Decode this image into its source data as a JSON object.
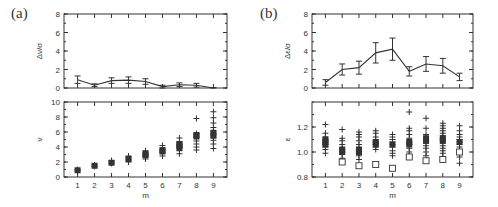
{
  "figure": {
    "panel_a_label": "(a)",
    "panel_b_label": "(b)"
  },
  "chart_data": [
    {
      "id": "a-top",
      "type": "line",
      "panel": "(a)",
      "title": "",
      "xlabel": "",
      "ylabel": "Δν/σ",
      "x": [
        1,
        2,
        3,
        4,
        5,
        6,
        7,
        8,
        9
      ],
      "values": [
        0.9,
        0.3,
        0.8,
        0.85,
        0.7,
        0.15,
        0.35,
        0.3,
        0.0
      ],
      "errors": [
        0.4,
        0.15,
        0.3,
        0.35,
        0.3,
        0.15,
        0.2,
        0.2,
        0.05
      ],
      "ylim": [
        0,
        8
      ],
      "yticks": [
        0,
        2,
        4,
        6,
        8
      ],
      "grid": false
    },
    {
      "id": "a-bottom",
      "type": "scatter",
      "panel": "(a)",
      "title": "",
      "xlabel": "m",
      "ylabel": "ν",
      "x": [
        1,
        2,
        3,
        4,
        5,
        6,
        7,
        8,
        9
      ],
      "series": [
        {
          "name": "crosses",
          "marker": "+",
          "points": [
            [
              1,
              0.8
            ],
            [
              1,
              1.0
            ],
            [
              2,
              1.4
            ],
            [
              2,
              1.6
            ],
            [
              3,
              1.8
            ],
            [
              3,
              2.0
            ],
            [
              3,
              2.2
            ],
            [
              4,
              2.0
            ],
            [
              4,
              2.3
            ],
            [
              4,
              2.6
            ],
            [
              4,
              2.8
            ],
            [
              5,
              2.4
            ],
            [
              5,
              2.8
            ],
            [
              5,
              3.1
            ],
            [
              5,
              3.5
            ],
            [
              6,
              2.8
            ],
            [
              6,
              3.2
            ],
            [
              6,
              3.6
            ],
            [
              6,
              4.2
            ],
            [
              7,
              3.1
            ],
            [
              7,
              3.5
            ],
            [
              7,
              3.9
            ],
            [
              7,
              4.3
            ],
            [
              7,
              4.7
            ],
            [
              7,
              5.2
            ],
            [
              8,
              3.6
            ],
            [
              8,
              4.0
            ],
            [
              8,
              4.4
            ],
            [
              8,
              4.8
            ],
            [
              8,
              5.3
            ],
            [
              8,
              5.8
            ],
            [
              8,
              7.8
            ],
            [
              9,
              3.8
            ],
            [
              9,
              4.4
            ],
            [
              9,
              4.9
            ],
            [
              9,
              5.3
            ],
            [
              9,
              5.7
            ],
            [
              9,
              6.1
            ],
            [
              9,
              6.6
            ],
            [
              9,
              7.2
            ],
            [
              9,
              7.9
            ],
            [
              9,
              8.7
            ]
          ]
        },
        {
          "name": "squares",
          "marker": "■",
          "points": [
            [
              1,
              0.9
            ],
            [
              2,
              1.5
            ],
            [
              3,
              1.9
            ],
            [
              4,
              2.4
            ],
            [
              5,
              2.9
            ],
            [
              5,
              3.1
            ],
            [
              6,
              3.4
            ],
            [
              6,
              3.6
            ],
            [
              7,
              3.9
            ],
            [
              7,
              4.2
            ],
            [
              7,
              4.4
            ],
            [
              8,
              5.4
            ],
            [
              8,
              5.6
            ],
            [
              9,
              5.5
            ],
            [
              9,
              5.9
            ]
          ]
        }
      ],
      "ylim": [
        0,
        10
      ],
      "yticks": [
        0,
        2,
        4,
        6,
        8,
        10
      ],
      "xticks": [
        1,
        2,
        3,
        4,
        5,
        6,
        7,
        8,
        9
      ],
      "grid": false
    },
    {
      "id": "b-top",
      "type": "line",
      "panel": "(b)",
      "title": "",
      "xlabel": "",
      "ylabel": "Δε/σ",
      "x": [
        1,
        2,
        3,
        4,
        5,
        6,
        7,
        8,
        9
      ],
      "values": [
        0.6,
        2.0,
        2.2,
        3.8,
        4.2,
        1.8,
        2.6,
        2.4,
        1.2
      ],
      "errors": [
        0.3,
        0.6,
        0.7,
        1.1,
        1.2,
        0.5,
        0.8,
        0.8,
        0.4
      ],
      "ylim": [
        0,
        8
      ],
      "yticks": [
        0,
        2,
        4,
        6,
        8
      ],
      "grid": false
    },
    {
      "id": "b-bottom",
      "type": "scatter",
      "panel": "(b)",
      "title": "",
      "xlabel": "m",
      "ylabel": "ε",
      "x": [
        1,
        2,
        3,
        4,
        5,
        6,
        7,
        8,
        9
      ],
      "series": [
        {
          "name": "crosses",
          "marker": "+",
          "points": [
            [
              1,
              0.99
            ],
            [
              1,
              1.02
            ],
            [
              1,
              1.04
            ],
            [
              1,
              1.06
            ],
            [
              1,
              1.08
            ],
            [
              1,
              1.1
            ],
            [
              1,
              1.12
            ],
            [
              1,
              1.15
            ],
            [
              1,
              1.22
            ],
            [
              2,
              0.92
            ],
            [
              2,
              0.95
            ],
            [
              2,
              0.98
            ],
            [
              2,
              1.0
            ],
            [
              2,
              1.03
            ],
            [
              2,
              1.06
            ],
            [
              2,
              1.09
            ],
            [
              2,
              1.11
            ],
            [
              2,
              1.18
            ],
            [
              3,
              0.94
            ],
            [
              3,
              0.97
            ],
            [
              3,
              0.99
            ],
            [
              3,
              1.01
            ],
            [
              3,
              1.03
            ],
            [
              3,
              1.06
            ],
            [
              3,
              1.09
            ],
            [
              3,
              1.12
            ],
            [
              3,
              1.14
            ],
            [
              3,
              1.16
            ],
            [
              4,
              1.02
            ],
            [
              4,
              1.04
            ],
            [
              4,
              1.06
            ],
            [
              4,
              1.08
            ],
            [
              4,
              1.1
            ],
            [
              4,
              1.12
            ],
            [
              4,
              1.15
            ],
            [
              4,
              1.17
            ],
            [
              5,
              0.97
            ],
            [
              5,
              0.99
            ],
            [
              5,
              1.01
            ],
            [
              5,
              1.04
            ],
            [
              5,
              1.06
            ],
            [
              5,
              1.08
            ],
            [
              5,
              1.1
            ],
            [
              5,
              1.12
            ],
            [
              5,
              1.14
            ],
            [
              6,
              0.97
            ],
            [
              6,
              1.0
            ],
            [
              6,
              1.03
            ],
            [
              6,
              1.06
            ],
            [
              6,
              1.08
            ],
            [
              6,
              1.11
            ],
            [
              6,
              1.14
            ],
            [
              6,
              1.17
            ],
            [
              6,
              1.19
            ],
            [
              6,
              1.32
            ],
            [
              7,
              0.97
            ],
            [
              7,
              1.0
            ],
            [
              7,
              1.03
            ],
            [
              7,
              1.05
            ],
            [
              7,
              1.07
            ],
            [
              7,
              1.09
            ],
            [
              7,
              1.11
            ],
            [
              7,
              1.14
            ],
            [
              7,
              1.19
            ],
            [
              7,
              1.27
            ],
            [
              8,
              0.96
            ],
            [
              8,
              0.99
            ],
            [
              8,
              1.01
            ],
            [
              8,
              1.03
            ],
            [
              8,
              1.05
            ],
            [
              8,
              1.07
            ],
            [
              8,
              1.09
            ],
            [
              8,
              1.11
            ],
            [
              8,
              1.13
            ],
            [
              8,
              1.15
            ],
            [
              8,
              1.17
            ],
            [
              8,
              1.19
            ],
            [
              8,
              1.21
            ],
            [
              8,
              1.23
            ],
            [
              9,
              0.91
            ],
            [
              9,
              0.96
            ],
            [
              9,
              0.99
            ],
            [
              9,
              1.02
            ],
            [
              9,
              1.04
            ],
            [
              9,
              1.06
            ],
            [
              9,
              1.08
            ],
            [
              9,
              1.1
            ],
            [
              9,
              1.12
            ],
            [
              9,
              1.14
            ],
            [
              9,
              1.17
            ],
            [
              9,
              1.21
            ]
          ]
        },
        {
          "name": "squares-filled",
          "marker": "■",
          "points": [
            [
              1,
              1.06
            ],
            [
              1,
              1.08
            ],
            [
              1,
              1.1
            ],
            [
              2,
              1.0
            ],
            [
              2,
              1.02
            ],
            [
              3,
              1.0
            ],
            [
              3,
              1.02
            ],
            [
              4,
              1.06
            ],
            [
              4,
              1.08
            ],
            [
              5,
              1.06
            ],
            [
              6,
              1.06
            ],
            [
              6,
              1.08
            ],
            [
              7,
              1.09
            ],
            [
              7,
              1.11
            ],
            [
              8,
              1.09
            ],
            [
              8,
              1.11
            ],
            [
              9,
              1.08
            ]
          ]
        },
        {
          "name": "squares-open",
          "marker": "□",
          "points": [
            [
              2,
              0.92
            ],
            [
              3,
              0.89
            ],
            [
              4,
              0.9
            ],
            [
              5,
              0.87
            ],
            [
              6,
              0.96
            ],
            [
              7,
              0.93
            ],
            [
              8,
              0.94
            ],
            [
              9,
              1.0
            ]
          ]
        }
      ],
      "ylim": [
        0.8,
        1.4
      ],
      "yticks": [
        0.8,
        1.0,
        1.2
      ],
      "ytick_labels": [
        "0.8",
        "1.0",
        "1.2"
      ],
      "xticks": [
        1,
        2,
        3,
        4,
        5,
        6,
        7,
        8,
        9
      ],
      "grid": false
    }
  ]
}
